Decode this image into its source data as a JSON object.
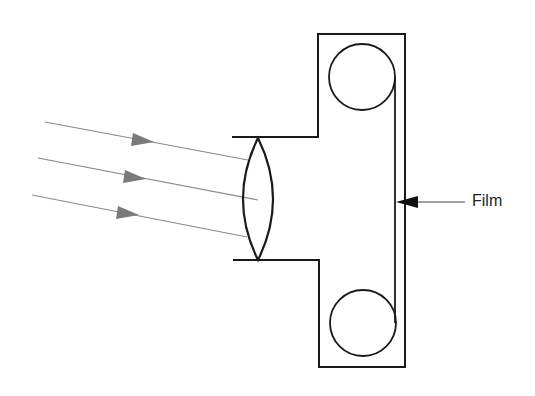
{
  "diagram": {
    "labels": {
      "film": "Film"
    },
    "components": [
      {
        "name": "incoming-light-rays",
        "count": 3
      },
      {
        "name": "converging-lens"
      },
      {
        "name": "camera-body"
      },
      {
        "name": "film-supply-spool"
      },
      {
        "name": "film-takeup-spool"
      },
      {
        "name": "film-strip"
      }
    ],
    "colors": {
      "stroke": "#1a1a1a",
      "ray": "#8a8a8a",
      "arrowhead": "#7a7a7a",
      "background": "#ffffff"
    }
  }
}
